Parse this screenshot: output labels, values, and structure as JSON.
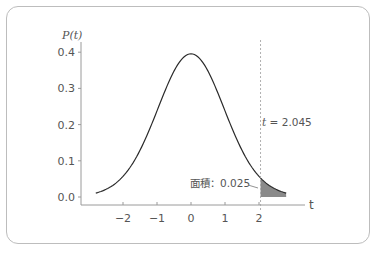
{
  "chart_data": {
    "type": "line",
    "title": "",
    "xlabel": "t",
    "ylabel": "P(t)",
    "x_ticks": [
      "−2",
      "−1",
      "0",
      "1",
      "2"
    ],
    "x_tick_values": [
      -2,
      -1,
      0,
      1,
      2
    ],
    "y_ticks": [
      "0.0",
      "0.1",
      "0.2",
      "0.3",
      "0.4"
    ],
    "y_tick_values": [
      0.0,
      0.1,
      0.2,
      0.3,
      0.4
    ],
    "xlim": [
      -3.2,
      3.4
    ],
    "ylim": [
      0,
      0.42
    ],
    "grid": false,
    "series": [
      {
        "name": "P(t)",
        "description": "t-distribution probability density curve",
        "x": [
          -2.8,
          -2.5,
          -2.0,
          -1.5,
          -1.0,
          -0.5,
          0,
          0.5,
          1.0,
          1.5,
          2.0,
          2.5,
          2.8
        ],
        "values": [
          0.008,
          0.018,
          0.054,
          0.13,
          0.242,
          0.352,
          0.399,
          0.352,
          0.242,
          0.13,
          0.054,
          0.018,
          0.008
        ]
      }
    ],
    "shaded_region": {
      "from": 2.045,
      "to": 2.8,
      "color": "#8a8a8a",
      "area": 0.025
    },
    "annotations": [
      {
        "text": "t = 2.045",
        "x": 2.045,
        "type": "vertical-dashed-line"
      },
      {
        "text": "面積：0.025",
        "points_to": "shaded_region"
      }
    ]
  },
  "labels": {
    "ylabel_P": "P",
    "ylabel_paren": "(t)",
    "xname": "t",
    "cutoff_t": "t",
    "cutoff_eq": " = 2.045",
    "area": "面積：0.025"
  }
}
